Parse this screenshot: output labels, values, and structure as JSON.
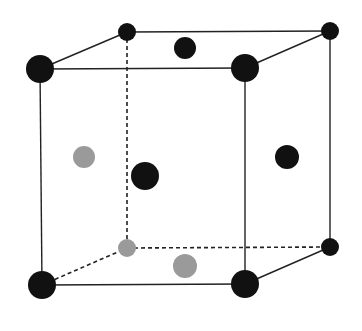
{
  "diagram": {
    "type": "crystal-unit-cell",
    "colors": {
      "background": "#ffffff",
      "edge": "#222222",
      "atom_dark": "#111111",
      "atom_light": "#9a9a9a"
    },
    "edges": [
      {
        "id": "front-top",
        "from": "ftl",
        "to": "ftr",
        "style": "solid"
      },
      {
        "id": "front-bottom",
        "from": "fbl",
        "to": "fbr",
        "style": "solid"
      },
      {
        "id": "front-left",
        "from": "ftl",
        "to": "fbl",
        "style": "solid"
      },
      {
        "id": "front-right",
        "from": "ftr",
        "to": "fbr",
        "style": "solid"
      },
      {
        "id": "back-top",
        "from": "btl",
        "to": "btr",
        "style": "solid"
      },
      {
        "id": "back-right",
        "from": "btr",
        "to": "bbr",
        "style": "solid"
      },
      {
        "id": "top-left-depth",
        "from": "ftl",
        "to": "btl",
        "style": "solid"
      },
      {
        "id": "top-right-depth",
        "from": "ftr",
        "to": "btr",
        "style": "solid"
      },
      {
        "id": "bottom-right-depth",
        "from": "fbr",
        "to": "bbr",
        "style": "solid"
      },
      {
        "id": "back-left",
        "from": "btl",
        "to": "bbl",
        "style": "dashed"
      },
      {
        "id": "back-bottom",
        "from": "bbl",
        "to": "bbr",
        "style": "dashed"
      },
      {
        "id": "bottom-left-depth",
        "from": "fbl",
        "to": "bbl",
        "style": "dashed"
      }
    ],
    "atoms": [
      {
        "id": "btl",
        "name": "corner-back-top-left",
        "cx": 127,
        "cy": 32,
        "r": 9,
        "shade": "dark"
      },
      {
        "id": "btr",
        "name": "corner-back-top-right",
        "cx": 330,
        "cy": 31,
        "r": 9,
        "shade": "dark"
      },
      {
        "id": "bbl",
        "name": "corner-back-bottom-left",
        "cx": 127,
        "cy": 248,
        "r": 9,
        "shade": "light"
      },
      {
        "id": "bbr",
        "name": "corner-back-bottom-right",
        "cx": 330,
        "cy": 247,
        "r": 9,
        "shade": "dark"
      },
      {
        "id": "top-face",
        "name": "face-center-top",
        "cx": 185,
        "cy": 48,
        "r": 11,
        "shade": "dark"
      },
      {
        "id": "left-face",
        "name": "face-center-left",
        "cx": 84,
        "cy": 157,
        "r": 11,
        "shade": "light"
      },
      {
        "id": "right-face",
        "name": "face-center-right",
        "cx": 287,
        "cy": 157,
        "r": 12,
        "shade": "dark"
      },
      {
        "id": "bottom-face",
        "name": "face-center-bottom",
        "cx": 185,
        "cy": 266,
        "r": 12,
        "shade": "light"
      },
      {
        "id": "body",
        "name": "body-center",
        "cx": 145,
        "cy": 176,
        "r": 14,
        "shade": "dark"
      },
      {
        "id": "ftl",
        "name": "corner-front-top-left",
        "cx": 40,
        "cy": 69,
        "r": 14,
        "shade": "dark"
      },
      {
        "id": "ftr",
        "name": "corner-front-top-right",
        "cx": 245,
        "cy": 68,
        "r": 14,
        "shade": "dark"
      },
      {
        "id": "fbl",
        "name": "corner-front-bottom-left",
        "cx": 42,
        "cy": 285,
        "r": 14,
        "shade": "dark"
      },
      {
        "id": "fbr",
        "name": "corner-front-bottom-right",
        "cx": 245,
        "cy": 284,
        "r": 14,
        "shade": "dark"
      }
    ]
  }
}
